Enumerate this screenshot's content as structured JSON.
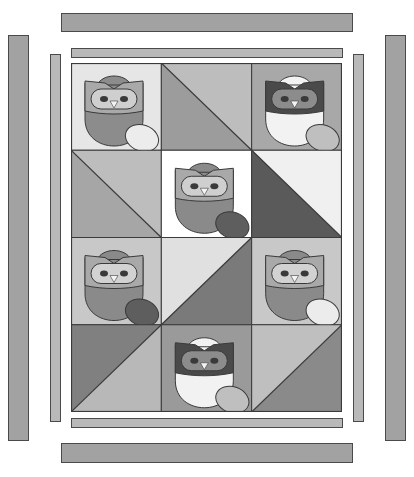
{
  "colors": {
    "outline": "#3a3a3a",
    "border_outer": "#a2a2a2",
    "border_inner": "#b9b9b9",
    "white": "#ffffff",
    "very_light": "#ececec",
    "light": "#d2d2d2",
    "mid_light": "#bfbfbf",
    "mid": "#a8a8a8",
    "mid_dark": "#8f8f8f",
    "dark": "#6e6e6e",
    "darkest": "#4d4d4d"
  },
  "borders": {
    "outer_top": {
      "x": 61,
      "y": 13,
      "w": 292,
      "h": 19,
      "color": "#a2a2a2"
    },
    "outer_bottom": {
      "x": 61,
      "y": 443,
      "w": 292,
      "h": 20,
      "color": "#a2a2a2"
    },
    "outer_left": {
      "x": 8,
      "y": 35,
      "w": 21,
      "h": 406,
      "color": "#a2a2a2"
    },
    "outer_right": {
      "x": 385,
      "y": 35,
      "w": 21,
      "h": 406,
      "color": "#a2a2a2"
    },
    "inner_top": {
      "x": 71,
      "y": 48,
      "w": 272,
      "h": 10,
      "color": "#b9b9b9"
    },
    "inner_bottom": {
      "x": 71,
      "y": 418,
      "w": 272,
      "h": 10,
      "color": "#b9b9b9"
    },
    "inner_left": {
      "x": 50,
      "y": 54,
      "w": 11,
      "h": 368,
      "color": "#b9b9b9"
    },
    "inner_right": {
      "x": 353,
      "y": 54,
      "w": 11,
      "h": 368,
      "color": "#b9b9b9"
    }
  },
  "quilt": {
    "cols": 3,
    "rows": 4,
    "blocks": [
      {
        "type": "owl",
        "bg": "#e6e6e6",
        "body": "#8c8c8c",
        "mask": "#a9a9a9",
        "face": "#cfcfcf",
        "egg": "#ececec"
      },
      {
        "type": "triangle",
        "dir": "tl-br",
        "a": "#bdbdbd",
        "b": "#9c9c9c"
      },
      {
        "type": "owl",
        "bg": "#a8a8a8",
        "body": "#f2f2f2",
        "mask": "#4a4a4a",
        "face": "#8c8c8c",
        "egg": "#bfbfbf"
      },
      {
        "type": "triangle",
        "dir": "tl-br",
        "a": "#bdbdbd",
        "b": "#a6a6a6"
      },
      {
        "type": "owl",
        "bg": "#ffffff",
        "body": "#8a8a8a",
        "mask": "#a9a9a9",
        "face": "#cfcfcf",
        "egg": "#5e5e5e"
      },
      {
        "type": "triangle",
        "dir": "tl-br",
        "a": "#f0f0f0",
        "b": "#5a5a5a"
      },
      {
        "type": "owl",
        "bg": "#c8c8c8",
        "body": "#8a8a8a",
        "mask": "#a9a9a9",
        "face": "#d2d2d2",
        "egg": "#5e5e5e"
      },
      {
        "type": "triangle",
        "dir": "bl-tr",
        "a": "#e0e0e0",
        "b": "#7a7a7a"
      },
      {
        "type": "owl",
        "bg": "#c8c8c8",
        "body": "#8a8a8a",
        "mask": "#a9a9a9",
        "face": "#d2d2d2",
        "egg": "#ececec"
      },
      {
        "type": "triangle",
        "dir": "bl-tr",
        "a": "#808080",
        "b": "#b8b8b8"
      },
      {
        "type": "owl",
        "bg": "#9a9a9a",
        "body": "#f2f2f2",
        "mask": "#4a4a4a",
        "face": "#8c8c8c",
        "egg": "#bfbfbf"
      },
      {
        "type": "triangle",
        "dir": "bl-tr",
        "a": "#bfbfbf",
        "b": "#8a8a8a"
      }
    ]
  }
}
